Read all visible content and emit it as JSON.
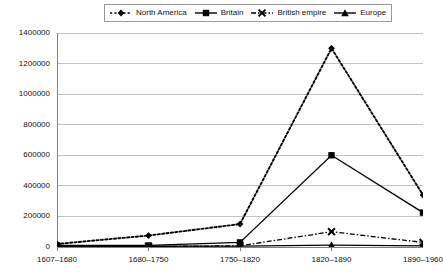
{
  "chart_data": {
    "type": "line",
    "title": "",
    "xlabel": "",
    "ylabel": "",
    "categories": [
      "1607–1680",
      "1680–1750",
      "1750–1820",
      "1820–1890",
      "1890–1960"
    ],
    "ylim": [
      0,
      1400000
    ],
    "yticks": [
      "0",
      "200000",
      "400000",
      "600000",
      "800000",
      "1000000",
      "1200000",
      "1400000"
    ],
    "ytick_values": [
      0,
      200000,
      400000,
      600000,
      800000,
      1000000,
      1200000,
      1400000
    ],
    "grid": true,
    "legend_position": "top-center",
    "series": [
      {
        "name": "North America",
        "values": [
          20000,
          75000,
          150000,
          1300000,
          340000
        ],
        "marker": "diamond",
        "line_style": "dotted",
        "color": "#000000"
      },
      {
        "name": "Britain",
        "values": [
          10000,
          10000,
          30000,
          600000,
          225000
        ],
        "marker": "square",
        "line_style": "solid",
        "color": "#000000"
      },
      {
        "name": "British empire",
        "values": [
          2000,
          3000,
          8000,
          100000,
          30000
        ],
        "marker": "x",
        "line_style": "dash-dot",
        "color": "#000000"
      },
      {
        "name": "Europe",
        "values": [
          5000,
          5000,
          6000,
          12000,
          8000
        ],
        "marker": "triangle",
        "line_style": "solid",
        "color": "#000000"
      }
    ]
  },
  "legend": {
    "items": [
      {
        "label": "North America"
      },
      {
        "label": "Britain"
      },
      {
        "label": "British empire"
      },
      {
        "label": "Europe"
      }
    ]
  },
  "colors": {
    "axis": "#808080",
    "grid": "#b3b3b3",
    "series": "#000000",
    "text": "#111111",
    "legend_border": "#9a9a9a",
    "background": "#ffffff"
  }
}
